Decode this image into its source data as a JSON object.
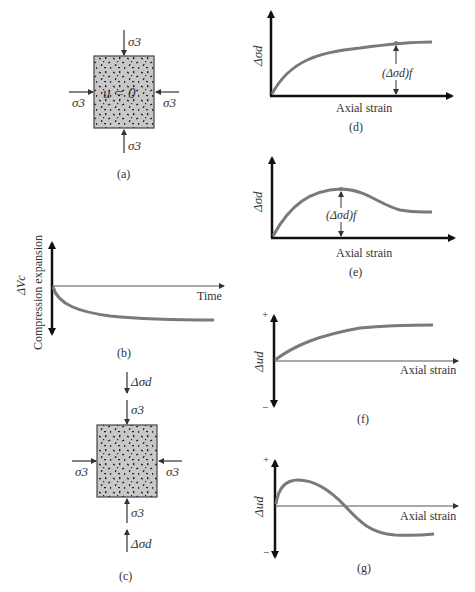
{
  "colors": {
    "curve": "#7a7a7a",
    "axis": "#111111",
    "sample_fill": "#c8c8c8",
    "text": "#333333"
  },
  "panel_a": {
    "label": "(a)",
    "top_stress": "σ3",
    "bottom_stress": "σ3",
    "left_stress": "σ3",
    "right_stress": "σ3",
    "pore_pressure": "u = 0"
  },
  "panel_b": {
    "label": "(b)",
    "ylabel_symbol": "ΔVc",
    "ylabel_text": "Compression  expansion",
    "xlabel": "Time"
  },
  "panel_c": {
    "label": "(c)",
    "top_deviator": "Δσd",
    "top_stress": "σ3",
    "bottom_stress": "σ3",
    "bottom_deviator": "Δσd",
    "left_stress": "σ3",
    "right_stress": "σ3"
  },
  "panel_d": {
    "label": "(d)",
    "ylabel": "Δσd",
    "xlabel": "Axial strain",
    "annotation": "(Δσd)f"
  },
  "panel_e": {
    "label": "(e)",
    "ylabel": "Δσd",
    "xlabel": "Axial strain",
    "annotation": "(Δσd)f"
  },
  "panel_f": {
    "label": "(f)",
    "ylabel": "Δud",
    "xlabel": "Axial strain",
    "plus": "+",
    "minus": "−"
  },
  "panel_g": {
    "label": "(g)",
    "ylabel": "Δud",
    "xlabel": "Axial strain",
    "plus": "+",
    "minus": "−"
  }
}
